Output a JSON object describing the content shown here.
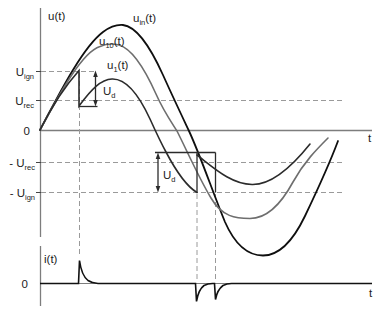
{
  "u_chart": {
    "axis_label": "u(t)",
    "t_label": "t",
    "zero_label": "0",
    "levels": {
      "u_ign": {
        "base": "U",
        "sub": "ign"
      },
      "u_rec": {
        "base": "U",
        "sub": "rec"
      },
      "neg_u_rec": {
        "base": "- U",
        "sub": "rec"
      },
      "neg_u_ign": {
        "base": "- U",
        "sub": "ign"
      }
    },
    "curves": {
      "u_in": {
        "base": "u",
        "sub": "in",
        "suffix": "(t)"
      },
      "u_10": {
        "base": "u",
        "sub": "10",
        "suffix": "(t)"
      },
      "u_1": {
        "base": "u",
        "sub": "1",
        "suffix": "(t)"
      }
    },
    "ud": {
      "base": "U",
      "sub": "d"
    }
  },
  "i_chart": {
    "axis_label": "i(t)",
    "zero_label": "0",
    "t_label": "t"
  },
  "colors": {
    "u_in": "#0f0f0f",
    "u_10": "#6e6e6e",
    "u_1": "#2b2b2b",
    "current": "#111111",
    "axis": "#7d7d7d",
    "dashed": "#9a9a9a",
    "annotation": "#2b2b2b",
    "tick": "#444444"
  }
}
